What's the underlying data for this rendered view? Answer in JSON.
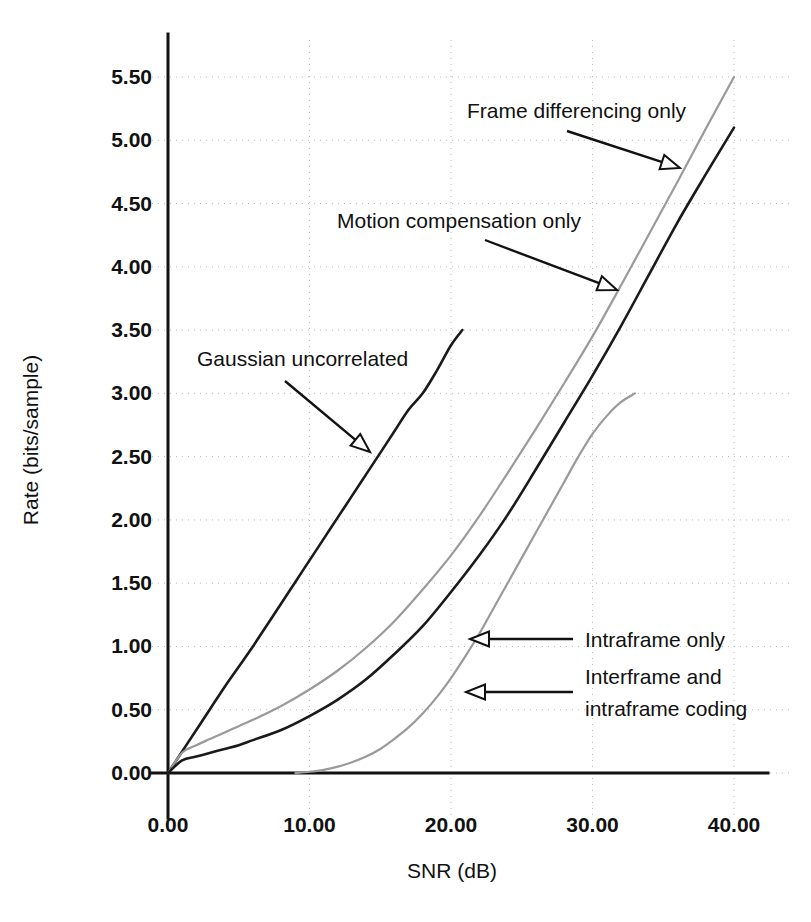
{
  "chart_data": {
    "type": "line",
    "title": "",
    "xlabel": "SNR (dB)",
    "ylabel": "Rate (bits/sample)",
    "xlim": [
      0,
      40
    ],
    "ylim": [
      0,
      5.5
    ],
    "grid": true,
    "legend_position": "inline-annotations",
    "xticks": [
      "0.00",
      "10.00",
      "20.00",
      "30.00",
      "40.00"
    ],
    "xtick_values": [
      0,
      10,
      20,
      30,
      40
    ],
    "yticks": [
      "0.00",
      "0.50",
      "1.00",
      "1.50",
      "2.00",
      "2.50",
      "3.00",
      "3.50",
      "4.00",
      "4.50",
      "5.00",
      "5.50"
    ],
    "ytick_values": [
      0,
      0.5,
      1.0,
      1.5,
      2.0,
      2.5,
      3.0,
      3.5,
      4.0,
      4.5,
      5.0,
      5.5
    ],
    "series": [
      {
        "name": "Gaussian uncorrelated",
        "color": "#1a1a1a",
        "style": "solid-dark",
        "x": [
          0,
          1,
          2,
          3,
          4,
          5,
          6,
          7,
          8,
          9,
          10,
          11,
          12,
          13,
          14,
          15,
          16,
          17,
          18,
          19,
          20,
          20.8
        ],
        "y": [
          0.0,
          0.17,
          0.34,
          0.51,
          0.68,
          0.84,
          1.0,
          1.17,
          1.34,
          1.51,
          1.68,
          1.85,
          2.02,
          2.19,
          2.36,
          2.53,
          2.7,
          2.87,
          3.0,
          3.18,
          3.38,
          3.5
        ]
      },
      {
        "name": "Frame differencing only",
        "color": "#9a9a9a",
        "style": "solid-light",
        "x": [
          0,
          1,
          2,
          3,
          4,
          5,
          6,
          8,
          10,
          12,
          14,
          16,
          18,
          20,
          22,
          24,
          26,
          28,
          30,
          32,
          34,
          36,
          38,
          40
        ],
        "y": [
          0.0,
          0.16,
          0.22,
          0.27,
          0.32,
          0.37,
          0.42,
          0.53,
          0.66,
          0.81,
          0.99,
          1.2,
          1.45,
          1.72,
          2.03,
          2.37,
          2.72,
          3.08,
          3.45,
          3.85,
          4.26,
          4.67,
          5.09,
          5.5
        ]
      },
      {
        "name": "Motion compensation only",
        "color": "#1a1a1a",
        "style": "solid-dark",
        "x": [
          0,
          1,
          2,
          3,
          4,
          5,
          6,
          8,
          10,
          12,
          14,
          16,
          18,
          20,
          22,
          24,
          26,
          28,
          30,
          32,
          34,
          36,
          38,
          40
        ],
        "y": [
          0.0,
          0.1,
          0.13,
          0.16,
          0.19,
          0.22,
          0.26,
          0.34,
          0.45,
          0.58,
          0.74,
          0.94,
          1.16,
          1.43,
          1.72,
          2.04,
          2.4,
          2.77,
          3.14,
          3.53,
          3.94,
          4.35,
          4.73,
          5.1
        ]
      },
      {
        "name": "Intraframe only",
        "color": "#9a9a9a",
        "style": "solid-light",
        "x": [
          9,
          10,
          11,
          12,
          13,
          14,
          15,
          16,
          17,
          18,
          19,
          20,
          21,
          22,
          23,
          24,
          25,
          26,
          27,
          28,
          29,
          30,
          31,
          32,
          33
        ],
        "y": [
          0.0,
          0.01,
          0.025,
          0.05,
          0.085,
          0.13,
          0.19,
          0.27,
          0.36,
          0.47,
          0.6,
          0.75,
          0.92,
          1.1,
          1.3,
          1.5,
          1.7,
          1.9,
          2.1,
          2.3,
          2.5,
          2.68,
          2.82,
          2.93,
          3.0
        ]
      }
    ],
    "annotations": [
      {
        "id": "frame-differencing",
        "label": "Frame differencing only",
        "text_x": 467,
        "text_y": 118,
        "arrow_from_x": 567,
        "arrow_from_y": 131,
        "arrow_to_x": 680,
        "arrow_to_y": 168,
        "arrow_dir": "down-right"
      },
      {
        "id": "motion-compensation",
        "label": "Motion compensation only",
        "text_x": 337,
        "text_y": 228,
        "arrow_from_x": 485,
        "arrow_from_y": 240,
        "arrow_to_x": 617,
        "arrow_to_y": 290,
        "arrow_dir": "down-right"
      },
      {
        "id": "gaussian-uncorrelated",
        "label": "Gaussian uncorrelated",
        "text_x": 197,
        "text_y": 366,
        "arrow_from_x": 285,
        "arrow_from_y": 381,
        "arrow_to_x": 370,
        "arrow_to_y": 452,
        "arrow_dir": "down-right"
      },
      {
        "id": "intraframe-only",
        "label": "Intraframe only",
        "text_x": 585,
        "text_y": 647,
        "arrow_from_x": 573,
        "arrow_from_y": 639,
        "arrow_to_x": 470,
        "arrow_to_y": 639,
        "arrow_dir": "left"
      },
      {
        "id": "interframe-intraframe",
        "label": "Interframe and",
        "label2": "intraframe coding",
        "text_x": 585,
        "text_y": 684,
        "text2_y": 716,
        "arrow_from_x": 573,
        "arrow_from_y": 692,
        "arrow_to_x": 466,
        "arrow_to_y": 692,
        "arrow_dir": "left"
      }
    ]
  },
  "axes": {
    "x_title": "SNR (dB)",
    "y_title": "Rate (bits/sample)"
  },
  "colors": {
    "dark_curve": "#1a1a1a",
    "light_curve": "#9a9a9a",
    "grid": "#b9b9b9",
    "axis": "#111111",
    "background": "#ffffff"
  }
}
